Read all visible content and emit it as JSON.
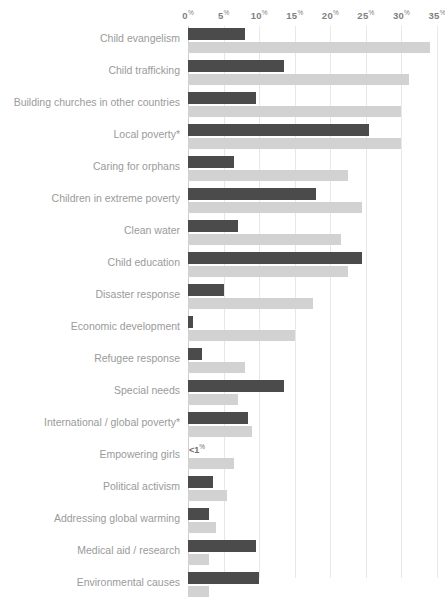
{
  "chart_data": {
    "type": "bar",
    "orientation": "horizontal",
    "title": "",
    "subtitle": "",
    "xlabel": "",
    "ylabel": "",
    "xlim": [
      0,
      35
    ],
    "grid": true,
    "legend": null,
    "tick_labels": [
      "0",
      "5",
      "10",
      "15",
      "20",
      "25",
      "30",
      "35"
    ],
    "tick_values": [
      0,
      5,
      10,
      15,
      20,
      25,
      30,
      35
    ],
    "tick_suffix": "%",
    "categories": [
      "Child evangelism",
      "Child trafficking",
      "Building churches in other countries",
      "Local poverty*",
      "Caring for orphans",
      "Children in extreme poverty",
      "Clean water",
      "Child education",
      "Disaster response",
      "Economic development",
      "Refugee response",
      "Special needs",
      "International / global poverty*",
      "Empowering girls",
      "Political activism",
      "Addressing global warming",
      "Medical aid / research",
      "Environmental causes"
    ],
    "series": [
      {
        "name": "dark",
        "color": "#4b4b4b",
        "values": [
          8,
          13.5,
          9.5,
          25.5,
          6.5,
          18,
          7,
          24.5,
          5,
          0.7,
          2,
          13.5,
          8.5,
          0.4,
          3.5,
          3,
          9.5,
          10
        ],
        "labels": [
          null,
          null,
          null,
          null,
          null,
          null,
          null,
          null,
          null,
          null,
          null,
          null,
          null,
          "<1%",
          null,
          null,
          null,
          null
        ]
      },
      {
        "name": "light",
        "color": "#d2d2d2",
        "values": [
          34,
          31,
          30,
          30,
          22.5,
          24.5,
          21.5,
          22.5,
          17.5,
          15,
          8,
          7,
          9,
          6.5,
          5.5,
          4,
          3,
          3
        ]
      }
    ]
  }
}
